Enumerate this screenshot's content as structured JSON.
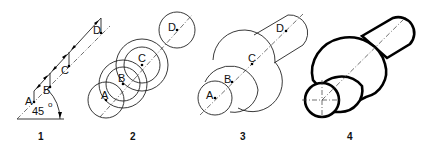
{
  "figure": {
    "panels": [
      {
        "number": "1",
        "points": [
          "A",
          "B",
          "C",
          "D"
        ],
        "angle_label": "45",
        "angle_unit": "o"
      },
      {
        "number": "2",
        "points": [
          "A",
          "B",
          "C",
          "D"
        ]
      },
      {
        "number": "3",
        "points": [
          "A",
          "B",
          "C",
          "D"
        ]
      },
      {
        "number": "4"
      }
    ]
  }
}
